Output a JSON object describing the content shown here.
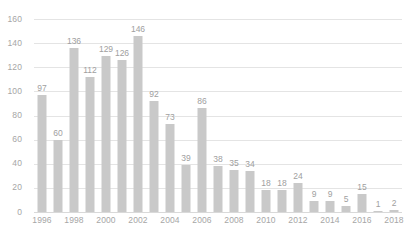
{
  "chart_data": {
    "type": "bar",
    "title": "",
    "subtitle": "",
    "xlabel": "",
    "ylabel": "",
    "categories": [
      "1996",
      "1997",
      "1998",
      "1999",
      "2000",
      "2001",
      "2002",
      "2003",
      "2004",
      "2005",
      "2006",
      "2007",
      "2008",
      "2009",
      "2010",
      "2011",
      "2012",
      "2013",
      "2014",
      "2015",
      "2016",
      "2017",
      "2018"
    ],
    "values": [
      97,
      60,
      136,
      112,
      129,
      126,
      146,
      92,
      73,
      39,
      86,
      38,
      35,
      34,
      18,
      18,
      24,
      9,
      9,
      5,
      15,
      1,
      2
    ],
    "data_labels": [
      "97",
      "60",
      "136",
      "112",
      "129",
      "126",
      "146",
      "92",
      "73",
      "39",
      "86",
      "38",
      "35",
      "34",
      "18",
      "18",
      "24",
      "9",
      "9",
      "5",
      "15",
      "1",
      "2"
    ],
    "ylim": [
      0,
      160
    ],
    "yticks": [
      0,
      20,
      40,
      60,
      80,
      100,
      120,
      140,
      160
    ],
    "ytick_labels": [
      "0",
      "20",
      "40",
      "60",
      "80",
      "100",
      "120",
      "140",
      "160"
    ],
    "xtick_labels": [
      "1996",
      "1998",
      "2000",
      "2002",
      "2004",
      "2006",
      "2008",
      "2010",
      "2012",
      "2014",
      "2016",
      "2018"
    ],
    "xtick_indices": [
      0,
      2,
      4,
      6,
      8,
      10,
      12,
      14,
      16,
      18,
      20,
      22
    ],
    "grid": true,
    "grid_axis": "y",
    "legend": false,
    "legend_position": "none",
    "series_name": "",
    "colors": {
      "bar": "#c9c9c9",
      "gridline": "#e4e4e4",
      "baseline": "#d9d9d9",
      "tick_text": "#a6a6a6",
      "label_text": "#a0a0a0",
      "background": "#ffffff"
    }
  }
}
